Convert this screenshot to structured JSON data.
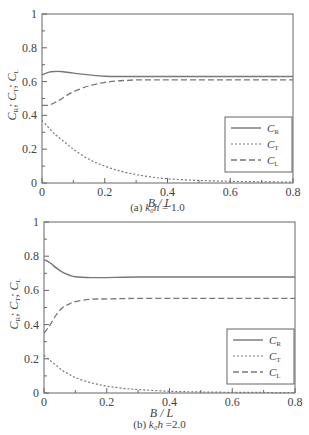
{
  "chart_data": [
    {
      "type": "line",
      "caption_prefix": "(a)",
      "caption_param": "k₀h",
      "caption_value": "= 1.0",
      "xlabel": "B / L",
      "ylabel": "C_R; C_T; C_L",
      "xlim": [
        0,
        0.8
      ],
      "ylim": [
        0,
        1
      ],
      "xticks": [
        "0",
        "0.2",
        "0.4",
        "0.6",
        "0.8"
      ],
      "yticks": [
        "0",
        "0.2",
        "0.4",
        "0.6",
        "0.8",
        "1"
      ],
      "grid": false,
      "legend_position": "lower right",
      "x": [
        0,
        0.02,
        0.04,
        0.06,
        0.08,
        0.1,
        0.15,
        0.2,
        0.25,
        0.3,
        0.35,
        0.4,
        0.5,
        0.6,
        0.7,
        0.8
      ],
      "series": [
        {
          "name": "C_R",
          "style": "solid",
          "values": [
            0.64,
            0.655,
            0.66,
            0.66,
            0.655,
            0.65,
            0.64,
            0.632,
            0.63,
            0.63,
            0.63,
            0.63,
            0.63,
            0.63,
            0.63,
            0.63
          ]
        },
        {
          "name": "C_T",
          "style": "dotted",
          "values": [
            0.37,
            0.33,
            0.29,
            0.26,
            0.23,
            0.2,
            0.14,
            0.1,
            0.07,
            0.05,
            0.035,
            0.025,
            0.015,
            0.01,
            0.007,
            0.005
          ]
        },
        {
          "name": "C_L",
          "style": "dashed",
          "values": [
            0.46,
            0.46,
            0.475,
            0.495,
            0.52,
            0.54,
            0.575,
            0.595,
            0.605,
            0.61,
            0.61,
            0.61,
            0.61,
            0.61,
            0.61,
            0.61
          ]
        }
      ]
    },
    {
      "type": "line",
      "caption_prefix": "(b)",
      "caption_param": "k₀h",
      "caption_value": "=2.0",
      "xlabel": "B / L",
      "ylabel": "C_R; C_T; C_L",
      "xlim": [
        0,
        0.8
      ],
      "ylim": [
        0,
        1
      ],
      "xticks": [
        "0",
        "0.2",
        "0.4",
        "0.6",
        "0.8"
      ],
      "yticks": [
        "0",
        "0.2",
        "0.4",
        "0.6",
        "0.8",
        "1"
      ],
      "grid": false,
      "legend_position": "lower right",
      "x": [
        0,
        0.02,
        0.04,
        0.06,
        0.08,
        0.1,
        0.15,
        0.2,
        0.25,
        0.3,
        0.4,
        0.5,
        0.6,
        0.7,
        0.8
      ],
      "series": [
        {
          "name": "C_R",
          "style": "solid",
          "values": [
            0.78,
            0.76,
            0.73,
            0.705,
            0.69,
            0.68,
            0.675,
            0.675,
            0.677,
            0.678,
            0.678,
            0.678,
            0.678,
            0.678,
            0.678
          ]
        },
        {
          "name": "C_T",
          "style": "dotted",
          "values": [
            0.22,
            0.19,
            0.16,
            0.13,
            0.11,
            0.09,
            0.06,
            0.04,
            0.028,
            0.02,
            0.01,
            0.006,
            0.004,
            0.003,
            0.002
          ]
        },
        {
          "name": "C_L",
          "style": "dashed",
          "values": [
            0.35,
            0.4,
            0.46,
            0.5,
            0.52,
            0.535,
            0.548,
            0.55,
            0.552,
            0.553,
            0.553,
            0.553,
            0.553,
            0.553,
            0.553
          ]
        }
      ]
    }
  ],
  "legend": [
    {
      "label": "C",
      "sub": "R"
    },
    {
      "label": "C",
      "sub": "T"
    },
    {
      "label": "C",
      "sub": "L"
    }
  ],
  "axis": {
    "xlabel": "B / L",
    "ylabel_parts": [
      "C",
      "R",
      "; C",
      "T",
      "; C",
      "L"
    ]
  },
  "captions": {
    "a": {
      "prefix": "(a)",
      "param": "k₀h",
      "value": "= 1.0"
    },
    "b": {
      "prefix": "(b)",
      "param": "k₀h",
      "value": "=2.0"
    }
  }
}
